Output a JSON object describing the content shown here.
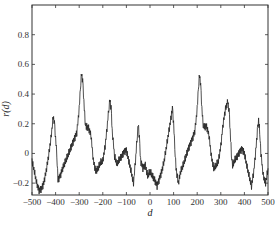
{
  "chart_data": {
    "type": "line",
    "title": "",
    "xlabel": "d",
    "ylabel": "r(d)",
    "xlim": [
      -500,
      500
    ],
    "ylim": [
      -0.28,
      1.0
    ],
    "xticks": [
      -500,
      -400,
      -300,
      -200,
      -100,
      0,
      100,
      200,
      300,
      400,
      500
    ],
    "xtick_labels": [
      "-500",
      "-400",
      "-300",
      "-200",
      "-100",
      "0",
      "100",
      "200",
      "300",
      "400",
      "500"
    ],
    "yticks": [
      -0.2,
      0,
      0.2,
      0.4,
      0.6,
      0.8
    ],
    "ytick_labels": [
      "-0.2",
      "0",
      "0.2",
      "0.4",
      "0.6",
      "0.8"
    ],
    "grid": false,
    "legend": null,
    "series": [
      {
        "name": "r(d)",
        "color": "#222222",
        "x": [
          -500,
          -490,
          -480,
          -470,
          -460,
          -450,
          -440,
          -430,
          -420,
          -410,
          -405,
          -400,
          -395,
          -390,
          -380,
          -370,
          -360,
          -350,
          -340,
          -330,
          -320,
          -310,
          -300,
          -295,
          -290,
          -285,
          -280,
          -275,
          -270,
          -260,
          -250,
          -240,
          -230,
          -220,
          -210,
          -200,
          -190,
          -180,
          -175,
          -170,
          -165,
          -160,
          -150,
          -140,
          -130,
          -120,
          -110,
          -100,
          -90,
          -80,
          -70,
          -60,
          -55,
          -50,
          -45,
          -40,
          -30,
          -20,
          -10,
          0,
          10,
          20,
          30,
          40,
          50,
          60,
          70,
          80,
          90,
          95,
          100,
          105,
          110,
          120,
          130,
          140,
          150,
          160,
          170,
          180,
          190,
          200,
          205,
          210,
          215,
          220,
          225,
          230,
          240,
          250,
          260,
          270,
          280,
          290,
          300,
          310,
          320,
          330,
          335,
          340,
          345,
          350,
          360,
          370,
          380,
          390,
          400,
          410,
          420,
          430,
          440,
          450,
          455,
          460,
          465,
          470,
          480,
          490,
          500
        ],
        "y": [
          -0.05,
          -0.12,
          -0.2,
          -0.25,
          -0.24,
          -0.2,
          -0.12,
          -0.02,
          0.1,
          0.25,
          0.2,
          0.1,
          0.0,
          -0.18,
          -0.15,
          -0.1,
          -0.06,
          -0.02,
          0.02,
          0.06,
          0.1,
          0.14,
          0.3,
          0.45,
          0.54,
          0.48,
          0.35,
          0.22,
          0.18,
          0.17,
          0.12,
          -0.05,
          -0.12,
          -0.1,
          -0.06,
          -0.05,
          0.05,
          0.2,
          0.3,
          0.36,
          0.3,
          0.15,
          -0.02,
          -0.07,
          -0.04,
          -0.02,
          0.01,
          0.02,
          -0.05,
          -0.12,
          -0.2,
          -0.02,
          0.1,
          0.2,
          0.1,
          -0.05,
          -0.1,
          -0.08,
          -0.15,
          -0.12,
          -0.15,
          -0.18,
          -0.22,
          -0.17,
          -0.12,
          -0.05,
          0.05,
          0.15,
          0.25,
          0.3,
          0.2,
          0.05,
          -0.1,
          -0.2,
          -0.12,
          -0.08,
          -0.03,
          0.02,
          0.06,
          0.1,
          0.15,
          0.3,
          0.45,
          0.53,
          0.45,
          0.3,
          0.2,
          0.18,
          0.18,
          0.12,
          -0.02,
          -0.1,
          -0.08,
          -0.05,
          0.05,
          0.2,
          0.3,
          0.35,
          0.28,
          0.15,
          0.0,
          -0.08,
          -0.04,
          -0.02,
          0.01,
          0.03,
          0.0,
          -0.08,
          -0.15,
          -0.22,
          -0.12,
          0.05,
          0.15,
          0.22,
          0.15,
          0.0,
          -0.15,
          -0.2,
          -0.1
        ]
      }
    ]
  },
  "plot": {
    "frame": {
      "left": 32,
      "top": 5,
      "right": 268,
      "bottom": 195
    },
    "line_color": "#222222",
    "noise_amplitude": 0.025
  }
}
